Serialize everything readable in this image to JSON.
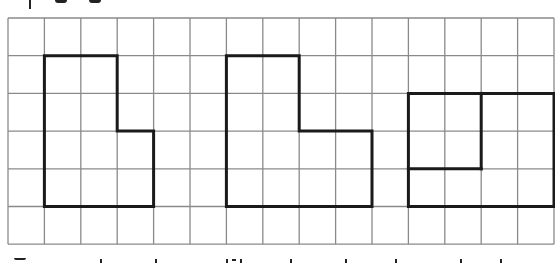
{
  "diagram": {
    "type": "grid-shapes",
    "grid": {
      "cols": 15,
      "rows": 6,
      "origin_x": 8,
      "origin_y": 18,
      "cell_w": 36.4,
      "cell_h": 37.7,
      "line_color": "#8a8a8a",
      "line_width": 1.3,
      "background": "#ffffff"
    },
    "shape_style": {
      "stroke": "#1a1a1a",
      "stroke_width": 3
    },
    "shapes": [
      {
        "name": "shape-left-l",
        "description": "L-shaped figure: 2 cols wide on top two rows, 3 cols wide on bottom two rows",
        "outline": [
          [
            1,
            1
          ],
          [
            3,
            1
          ],
          [
            3,
            3
          ],
          [
            4,
            3
          ],
          [
            4,
            5
          ],
          [
            1,
            5
          ]
        ],
        "inner_lines": []
      },
      {
        "name": "shape-middle-l",
        "description": "L-shaped figure: 2 cols wide on top two rows, 4 cols wide on bottom two rows",
        "outline": [
          [
            6,
            1
          ],
          [
            8,
            1
          ],
          [
            8,
            3
          ],
          [
            10,
            3
          ],
          [
            10,
            5
          ],
          [
            6,
            5
          ]
        ],
        "inner_lines": []
      },
      {
        "name": "shape-right-rect",
        "description": "4x3 rectangle with an inner L divider separating a 2x2 block",
        "outline": [
          [
            11,
            2
          ],
          [
            15,
            2
          ],
          [
            15,
            5
          ],
          [
            11,
            5
          ]
        ],
        "inner_lines": [
          [
            [
              13,
              2
            ],
            [
              13,
              4
            ]
          ],
          [
            [
              13,
              4
            ],
            [
              11,
              4
            ]
          ]
        ]
      }
    ],
    "clipped_text_fragments": {
      "top": [
        {
          "x": 29,
          "y": 0,
          "w": 2,
          "h": 9
        },
        {
          "x": 55,
          "y": 0,
          "w": 12,
          "h": 3
        },
        {
          "x": 89,
          "y": 0,
          "w": 12,
          "h": 3
        }
      ],
      "bottom": [
        {
          "x": 14,
          "y": 258,
          "w": 12,
          "h": 2
        },
        {
          "x": 100,
          "y": 259,
          "w": 2,
          "h": 4
        },
        {
          "x": 155,
          "y": 259,
          "w": 2,
          "h": 4
        },
        {
          "x": 226,
          "y": 259,
          "w": 2,
          "h": 4
        },
        {
          "x": 232,
          "y": 259,
          "w": 4,
          "h": 2
        },
        {
          "x": 240,
          "y": 259,
          "w": 2,
          "h": 4
        },
        {
          "x": 290,
          "y": 259,
          "w": 2,
          "h": 4
        },
        {
          "x": 345,
          "y": 259,
          "w": 2,
          "h": 4
        },
        {
          "x": 395,
          "y": 259,
          "w": 2,
          "h": 4
        },
        {
          "x": 460,
          "y": 259,
          "w": 2,
          "h": 4
        },
        {
          "x": 500,
          "y": 259,
          "w": 2,
          "h": 4
        }
      ]
    }
  }
}
